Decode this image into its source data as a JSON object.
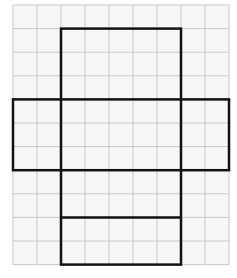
{
  "figure": {
    "label": ")",
    "grid": {
      "origin_x": 13,
      "origin_y": 5,
      "cols": 9,
      "rows": 11,
      "cell_w": 24,
      "cell_h": 23.6,
      "line_color": "#c8c8c8",
      "background": "#f7f7f7"
    },
    "outline_color": "#111111",
    "net": {
      "description": "Net of a rectangular prism (cross-shaped) drawn on square grid",
      "vertical_strip": {
        "col_start": 2,
        "col_end": 7,
        "row_start": 1,
        "row_end": 11
      },
      "horizontal_strip": {
        "col_start": 0,
        "col_end": 9,
        "row_start": 4,
        "row_end": 7
      },
      "inner_divider_row": 9
    }
  }
}
